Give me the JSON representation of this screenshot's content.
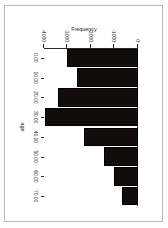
{
  "window": {
    "background_color": "#ffffff",
    "frame_color": "#b9b9b9"
  },
  "chart_data": {
    "type": "bar",
    "orientation": "vertical-negative",
    "rotation_degrees": 90,
    "title": "",
    "subtitle": "",
    "xlabel": "age",
    "ylabel": "Frequency",
    "categories": [
      "0.00",
      "10.00",
      "20.00",
      "30.00",
      "40.00",
      "50.00",
      "60.00",
      "70.00"
    ],
    "values": [
      -3000,
      -2600,
      -3400,
      -3950,
      -2300,
      -1450,
      -1000,
      -700
    ],
    "xtick_labels": [
      "0.00",
      "10.00",
      "20.00",
      "30.00",
      "40.00",
      "50.00",
      "60.00",
      "70.00"
    ],
    "ytick_labels": [
      "0",
      "-1000",
      "-2000",
      "-3000",
      "-4000"
    ],
    "ytick_values": [
      0,
      -1000,
      -2000,
      -3000,
      -4000
    ],
    "ylim": [
      -4000,
      0
    ],
    "grid": false,
    "legend": false,
    "legend_position": "none",
    "bar_color": "#120d0b",
    "axis_color": "#2b2b2b",
    "plot_background": "#ffffff"
  }
}
